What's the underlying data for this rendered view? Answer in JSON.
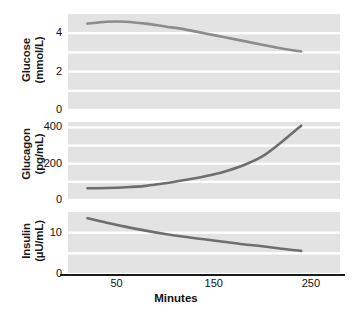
{
  "chart_data": {
    "type": "line",
    "title": "",
    "xlabel": "Minutes",
    "xlim": [
      0,
      280
    ],
    "xticks": [
      50,
      150,
      250
    ],
    "xtick_labels": [
      "50",
      "150",
      "250"
    ],
    "grid": true,
    "legend": "none",
    "panels": [
      {
        "name": "glucose",
        "ylabel_line1": "Glucose",
        "ylabel_line2": "(mmol/L)",
        "units": "mmol/L",
        "ylim": [
          0,
          5
        ],
        "yticks": [
          0,
          2,
          4
        ],
        "ytick_labels": [
          "0",
          "2",
          "4"
        ],
        "gridlines": [
          0,
          1,
          2,
          3,
          4
        ],
        "line_color": "#8c8c8c",
        "x": [
          20,
          40,
          60,
          80,
          100,
          120,
          140,
          160,
          180,
          200,
          220,
          240
        ],
        "y": [
          4.5,
          4.6,
          4.6,
          4.5,
          4.35,
          4.2,
          4.0,
          3.8,
          3.6,
          3.4,
          3.2,
          3.05
        ]
      },
      {
        "name": "glucagon",
        "ylabel_line1": "Glucagon",
        "ylabel_line2": "(pg/mL)",
        "units": "pg/mL",
        "ylim": [
          0,
          430
        ],
        "yticks": [
          0,
          200,
          400
        ],
        "ytick_labels": [
          "0",
          "200",
          "400"
        ],
        "gridlines": [
          0,
          100,
          200,
          300,
          400
        ],
        "line_color": "#6e6e6e",
        "x": [
          20,
          40,
          60,
          80,
          100,
          120,
          140,
          160,
          180,
          200,
          220,
          240
        ],
        "y": [
          65,
          66,
          70,
          78,
          92,
          110,
          130,
          155,
          190,
          240,
          320,
          410
        ]
      },
      {
        "name": "insulin",
        "ylabel_line1": "Insulin",
        "ylabel_line2": "(µU/mL)",
        "units": "µU/mL",
        "ylim": [
          0,
          15
        ],
        "yticks": [
          0,
          10
        ],
        "ytick_labels": [
          "0",
          "10"
        ],
        "gridlines": [
          0,
          5,
          10
        ],
        "line_color": "#6e6e6e",
        "x": [
          20,
          40,
          60,
          80,
          100,
          120,
          140,
          160,
          180,
          200,
          220,
          240
        ],
        "y": [
          13.5,
          12.4,
          11.4,
          10.5,
          9.7,
          9.0,
          8.4,
          7.8,
          7.2,
          6.7,
          6.1,
          5.6
        ]
      }
    ]
  }
}
